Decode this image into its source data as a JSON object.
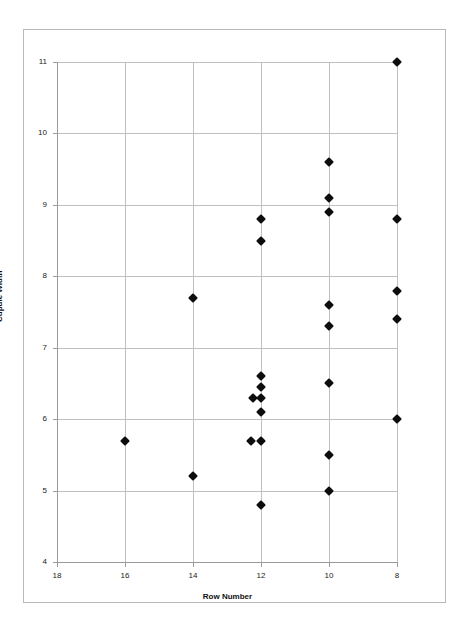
{
  "chart_data": {
    "type": "scatter",
    "title": "",
    "xlabel": "Row Number",
    "ylabel": "Cupule Width",
    "xlim": [
      18,
      8
    ],
    "ylim": [
      4,
      11
    ],
    "x_reversed": true,
    "xticks": [
      18,
      16,
      14,
      12,
      10,
      8
    ],
    "yticks": [
      4,
      5,
      6,
      7,
      8,
      9,
      10,
      11
    ],
    "xtick_labels": [
      "18",
      "16",
      "14",
      "12",
      "10",
      "8"
    ],
    "ytick_labels": [
      "4",
      "5",
      "6",
      "7",
      "8",
      "9",
      "10",
      "11"
    ],
    "grid": true,
    "grid_color": "#c0c0c0",
    "legend": false,
    "marker": "diamond",
    "marker_color": "#0d0d0d",
    "series": [
      {
        "name": "Cupule Width",
        "points": [
          {
            "x": 16.0,
            "y": 5.7
          },
          {
            "x": 14.0,
            "y": 7.7
          },
          {
            "x": 14.0,
            "y": 5.2
          },
          {
            "x": 12.0,
            "y": 8.8
          },
          {
            "x": 12.0,
            "y": 8.5
          },
          {
            "x": 12.0,
            "y": 6.6
          },
          {
            "x": 12.0,
            "y": 6.45
          },
          {
            "x": 12.0,
            "y": 6.3
          },
          {
            "x": 12.25,
            "y": 6.3
          },
          {
            "x": 12.0,
            "y": 6.1
          },
          {
            "x": 12.0,
            "y": 5.7
          },
          {
            "x": 12.3,
            "y": 5.7
          },
          {
            "x": 12.0,
            "y": 4.8
          },
          {
            "x": 10.0,
            "y": 9.6
          },
          {
            "x": 10.0,
            "y": 9.1
          },
          {
            "x": 10.0,
            "y": 8.9
          },
          {
            "x": 10.0,
            "y": 7.6
          },
          {
            "x": 10.0,
            "y": 7.3
          },
          {
            "x": 10.0,
            "y": 6.5
          },
          {
            "x": 10.0,
            "y": 5.5
          },
          {
            "x": 10.0,
            "y": 5.0
          },
          {
            "x": 8.0,
            "y": 11.0
          },
          {
            "x": 8.0,
            "y": 8.8
          },
          {
            "x": 8.0,
            "y": 7.8
          },
          {
            "x": 8.0,
            "y": 7.4
          },
          {
            "x": 8.0,
            "y": 6.0
          }
        ]
      }
    ]
  },
  "axes": {
    "y_title": "Cupule Width",
    "x_title": "Row Number"
  },
  "colors": {
    "marker": "#0d0d0d",
    "grid": "#c0c0c0",
    "axis": "#9a9a9a",
    "frame": "#b9b9b9",
    "background": "#ffffff"
  }
}
